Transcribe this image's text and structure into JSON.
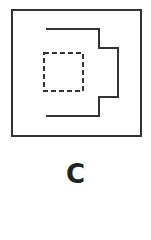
{
  "figure": {
    "label": "C",
    "stroke_color": "#333333",
    "outer_box": {
      "x": 12,
      "y": 10,
      "width": 129,
      "height": 126
    },
    "stepped_path_points": "46,29 99,29 99,48 118,48 118,97 99,97 99,116 46,116",
    "dashed_box": {
      "x": 44,
      "y": 53,
      "width": 39,
      "height": 38
    }
  }
}
